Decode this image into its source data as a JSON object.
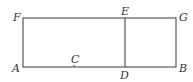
{
  "diagram": {
    "type": "geometry",
    "points": {
      "A": {
        "label": "A",
        "x": 23,
        "y": 67
      },
      "B": {
        "label": "B",
        "x": 176,
        "y": 67
      },
      "C": {
        "label": "C",
        "x": 74,
        "y": 67
      },
      "D": {
        "label": "D",
        "x": 125,
        "y": 67
      },
      "E": {
        "label": "E",
        "x": 125,
        "y": 18
      },
      "F": {
        "label": "F",
        "x": 23,
        "y": 18
      },
      "G": {
        "label": "G",
        "x": 176,
        "y": 18
      }
    },
    "segments": [
      [
        "A",
        "B"
      ],
      [
        "B",
        "G"
      ],
      [
        "G",
        "F"
      ],
      [
        "F",
        "A"
      ],
      [
        "D",
        "E"
      ]
    ],
    "stroke_color": "#555555"
  }
}
